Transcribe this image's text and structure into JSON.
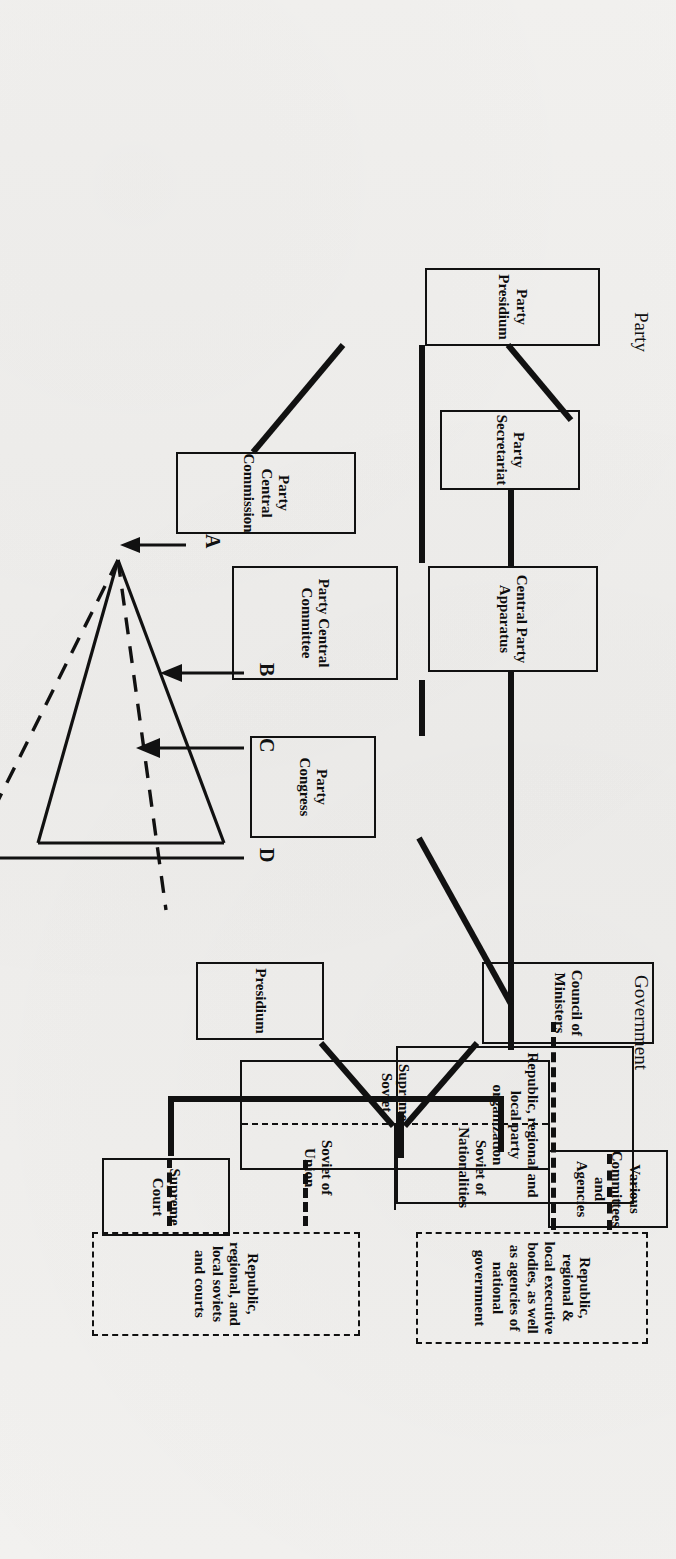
{
  "page": {
    "background_color": "#f1f0ee",
    "ink_color": "#111111",
    "orientation": "rotated-90-ccw-scan-of-book-page"
  },
  "figure": {
    "party": {
      "section_title": "Party",
      "boxes": [
        {
          "id": "party-presidium",
          "label": "Party Presidium"
        },
        {
          "id": "party-secretariat",
          "label": "Party Secretariat"
        },
        {
          "id": "central-party-apparatus",
          "label": "Central Party Apparatus"
        },
        {
          "id": "party-central-commission",
          "label": "Party Central Commission"
        },
        {
          "id": "party-central-committee",
          "label": "Party Central Committee"
        },
        {
          "id": "party-congress",
          "label": "Party Congress"
        },
        {
          "id": "republic-regional-local-party",
          "label": "Republic, regional and local party organization"
        }
      ]
    },
    "government": {
      "section_title": "Government",
      "boxes": [
        {
          "id": "presidium",
          "label": "Presidium"
        },
        {
          "id": "council-of-ministers",
          "label": "Council of Ministers"
        },
        {
          "id": "various-committees",
          "label": "Various Committees and Agencies"
        },
        {
          "id": "supreme-court",
          "label": "Supreme Court"
        }
      ],
      "supreme_soviet": {
        "label": "Supreme Soviet",
        "chambers": [
          "Soviet of Nationalities",
          "Soviet of Union"
        ]
      },
      "dashed_boxes": [
        {
          "id": "republic-regional-local-executive",
          "label": "Republic, regional & local executive bodies, as well as agencies of national government"
        },
        {
          "id": "republic-regional-local-soviets",
          "label": "Republic, regional, and local soviets and courts"
        }
      ]
    },
    "fan_diagram": {
      "apex_label": "A",
      "arrow_labels": [
        "B",
        "C",
        "D"
      ],
      "solid_rays": 2,
      "dashed_rays": 2
    }
  },
  "showthrough_text": {
    "note": "faint mirrored text from the reverse side of the page",
    "lines": [
      "every step of the way. To a large degree the two func-",
      "of the top Party leader in any given area is also",
      "ment in that area. Where this is not so, however,",
      "ing government, advise it, and even assume its",
      "functions. Thus, the governmental structure is",
      "as administrative instrument carrying out pre-"
    ],
    "heading": "SOVIET PRINCIPLE",
    "lines2": [
      "of the basic of coordination of plans among",
      "Presidium, which is the final adjudger of a",
      "Presidium had not itself issued a directive",
      "It was in early years that the draft was. It was several years.",
      "authority would in large measure be determined",
      "the one told by such the Central Committee",
      "more silent in form instead, in it is important",
      "and is mentioned, the Party would but the Central",
      "Presidium that will predominate and prevail. In other",
      "authority could no longer more accurate than even",
      "is said to final authority.",
      "the constitution of the Soviet Union does not state the real",
      "process again only in theory. The exact assignment of it",
      "entirely in doubt — but the real substance of power, the decid-",
      "are relative to the central government, as the one Party",
      "to be supreme. Furthermore, the constitution may be amended",
      "by one Party faction and there can be no specific body or one",
      "within its provisions. The Party itself was never abolished after",
      "the Party governing constitutions, and the Party powers and the",
      "all around will not see all the provisions of the fact that the",
      "the constitution can be changed and is subject to restatement of",
      "the law that it means to state; the party of which it can be",
      "the process at any time."
    ],
    "heading2": "THE SOVIET GOVERNMENT",
    "lines3": [
      "The legislature branch of the Soviet government nominally rests",
      "in a bicameral of two chambers, the Soviet of Union or Council",
      "of Union and Soviet of Nationalities. Deputies of elections are gov-",
      "erned that mean literally elected from these election districts and",
      "who can people the latter of elections in the first. In the Soviet",
      "of Nationalities, one thing is different; this representation is based",
      "on the autonomous provinces of national areas with a number",
      "from entire republics sending of the district; a few weaker and",
      "fewer members."
    ]
  }
}
